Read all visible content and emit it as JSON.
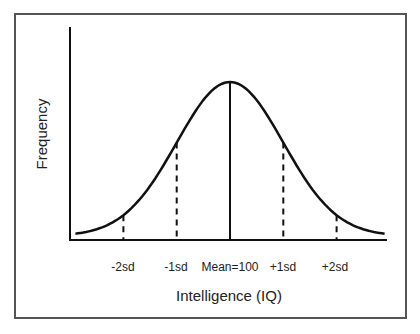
{
  "chart_data": {
    "type": "line",
    "title": "",
    "xlabel": "Intelligence (IQ)",
    "ylabel": "Frequency",
    "categories": [
      "-2sd",
      "-1sd",
      "Mean=100",
      "+1sd",
      "+2sd"
    ],
    "x": [
      -2,
      -1,
      0,
      1,
      2
    ],
    "series": [
      {
        "name": "Normal distribution",
        "values": [
          0.054,
          0.242,
          0.399,
          0.242,
          0.054
        ]
      }
    ],
    "markers": [
      {
        "label": "-2sd",
        "x": -2,
        "style": "dashed"
      },
      {
        "label": "-1sd",
        "x": -1,
        "style": "dashed"
      },
      {
        "label": "Mean=100",
        "x": 0,
        "style": "solid"
      },
      {
        "label": "+1sd",
        "x": 1,
        "style": "dashed"
      },
      {
        "label": "+2sd",
        "x": 2,
        "style": "dashed"
      }
    ],
    "xlim": [
      -2.9,
      2.9
    ],
    "grid": false,
    "legend": "none"
  },
  "colors": {
    "line": "#111111",
    "frame": "#555555",
    "text": "#222222"
  }
}
